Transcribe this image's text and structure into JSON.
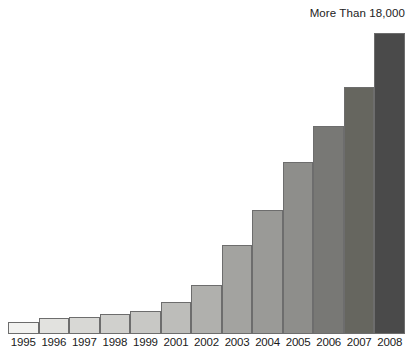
{
  "chart_data": {
    "type": "bar",
    "title": "",
    "subtitle": "",
    "xlabel": "",
    "ylabel": "",
    "grid": false,
    "legend": null,
    "ylim": [
      0,
      18000
    ],
    "annotations": [
      {
        "text": "More Than 18,000",
        "target_category": "2008",
        "position": "top-right"
      }
    ],
    "categories": [
      "1995",
      "1996",
      "1997",
      "1998",
      "1999",
      "2001",
      "2002",
      "2003",
      "2004",
      "2005",
      "2006",
      "2007",
      "2008"
    ],
    "values": [
      720,
      960,
      1020,
      1200,
      1380,
      1920,
      2940,
      5340,
      7440,
      10320,
      12480,
      14820,
      18000
    ],
    "bar_pixel_heights": [
      12,
      16,
      17,
      20,
      23,
      32,
      49,
      89,
      124,
      172,
      208,
      247,
      301
    ],
    "bar_colors": [
      "#f2f2f0",
      "#e2e2df",
      "#d8d8d5",
      "#d0d0cd",
      "#c8c8c5",
      "#bdbdba",
      "#b0b0ad",
      "#a3a3a0",
      "#9a9a97",
      "#8e8e8b",
      "#787875",
      "#66665f",
      "#4a4a4a"
    ],
    "bar_outline_color": "#6d6d6d"
  },
  "axis": {
    "tick_labels": [
      "1995",
      "1996",
      "1997",
      "1998",
      "1999",
      "2001",
      "2002",
      "2003",
      "2004",
      "2005",
      "2006",
      "2007",
      "2008"
    ]
  }
}
